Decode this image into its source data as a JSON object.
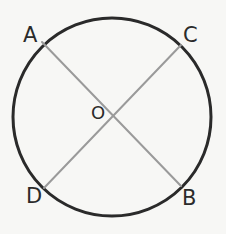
{
  "diagram": {
    "background_color": "#f7f7f5",
    "circle": {
      "name": "circle-outline",
      "center_x": 112,
      "center_y": 117,
      "radius": 99,
      "stroke_color": "#2a2a2a",
      "stroke_width": 3,
      "fill": "none"
    },
    "chords": [
      {
        "name": "chord-AB",
        "from_label": "A",
        "to_label": "B",
        "x1": 42,
        "y1": 42,
        "x2": 181,
        "y2": 186,
        "stroke_color": "#9a9a9a",
        "stroke_width": 2
      },
      {
        "name": "chord-CD",
        "from_label": "C",
        "to_label": "D",
        "x1": 181,
        "y1": 45,
        "x2": 44,
        "y2": 188,
        "stroke_color": "#9a9a9a",
        "stroke_width": 2
      }
    ],
    "labels": {
      "a": "A",
      "b": "B",
      "c": "C",
      "d": "D",
      "o": "O"
    },
    "label_color": "#2b2b2b",
    "intersection": {
      "name": "intersection-point-O",
      "label": "O",
      "x": 112,
      "y": 116
    }
  }
}
